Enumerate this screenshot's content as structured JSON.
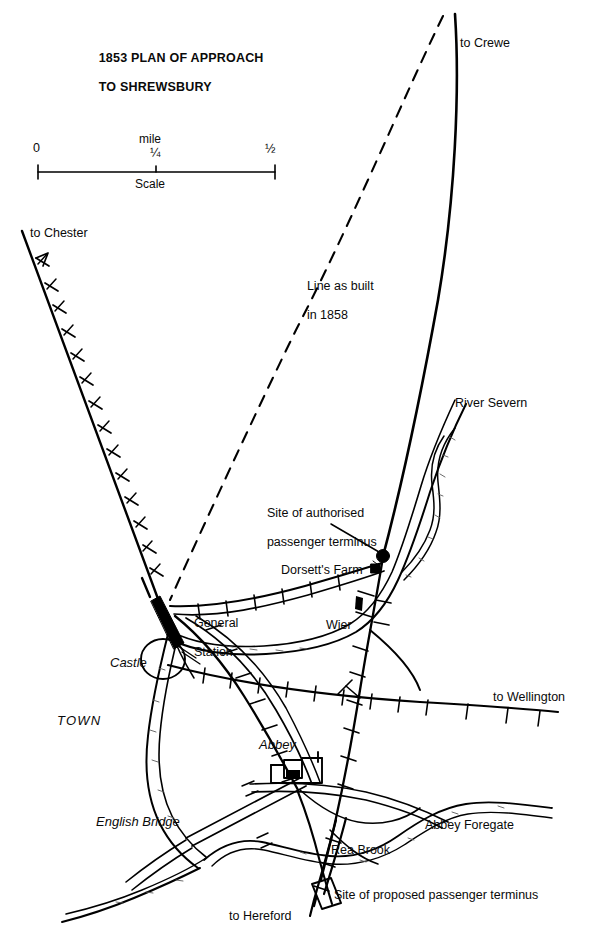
{
  "figure": {
    "kind": "historical-railway-plan",
    "title_line1": "1853 PLAN OF APPROACH",
    "title_line2": "TO SHREWSBURY",
    "ink_color": "#000000",
    "background_color": "#ffffff"
  },
  "scale_bar": {
    "caption": "Scale",
    "unit_label": "mile",
    "ticks": [
      {
        "label": "0"
      },
      {
        "label": "¼"
      },
      {
        "label": "½"
      }
    ]
  },
  "destinations": [
    {
      "name": "to Crewe"
    },
    {
      "name": "to Chester"
    },
    {
      "name": "to Wellington"
    },
    {
      "name": "to Hereford"
    }
  ],
  "annotations": [
    {
      "line1": "Line as built",
      "line2": "in 1858"
    },
    {
      "line1": "Site of authorised",
      "line2": "passenger terminus"
    },
    {
      "line1": "Site of proposed passenger terminus",
      "line2": ""
    }
  ],
  "places": [
    {
      "name": "General Station",
      "line1": "General",
      "line2": "Station",
      "style": "plain"
    },
    {
      "name": "Dorsett's Farm",
      "line1": "Dorsett's Farm",
      "line2": "",
      "style": "plain"
    },
    {
      "name": "Wier",
      "line1": "Wier",
      "line2": "",
      "style": "plain"
    },
    {
      "name": "River Severn",
      "line1": "River Severn",
      "line2": "",
      "style": "plain"
    },
    {
      "name": "Rea Brook",
      "line1": "Rea Brook",
      "line2": "",
      "style": "plain"
    },
    {
      "name": "Abbey Foregate",
      "line1": "Abbey Foregate",
      "line2": "",
      "style": "plain"
    },
    {
      "name": "Castle",
      "line1": "Castle",
      "line2": "",
      "style": "italic"
    },
    {
      "name": "TOWN",
      "line1": "TOWN",
      "line2": "",
      "style": "italic"
    },
    {
      "name": "Abbey",
      "line1": "Abbey",
      "line2": "",
      "style": "italic"
    },
    {
      "name": "English Bridge",
      "line1": "English Bridge",
      "line2": "",
      "style": "italic"
    }
  ],
  "labels": {
    "to_crewe": "to Crewe",
    "to_chester": "to Chester",
    "to_wellington": "to Wellington",
    "to_hereford": "to Hereford",
    "line_as_built_1": "Line as built",
    "line_as_built_2": "in 1858",
    "authorised_1": "Site of authorised",
    "authorised_2": "passenger terminus",
    "proposed": "Site of proposed passenger terminus",
    "general_station_1": "General",
    "general_station_2": "Station",
    "dorsetts_farm": "Dorsett's Farm",
    "wier": "Wier",
    "river_severn": "River Severn",
    "rea_brook": "Rea Brook",
    "abbey_foregate": "Abbey Foregate",
    "castle": "Castle",
    "town": "TOWN",
    "abbey": "Abbey",
    "english_bridge": "English Bridge",
    "scale_zero": "0",
    "scale_quarter": "¼",
    "scale_half": "½",
    "scale_mile": "mile",
    "scale_caption": "Scale"
  }
}
